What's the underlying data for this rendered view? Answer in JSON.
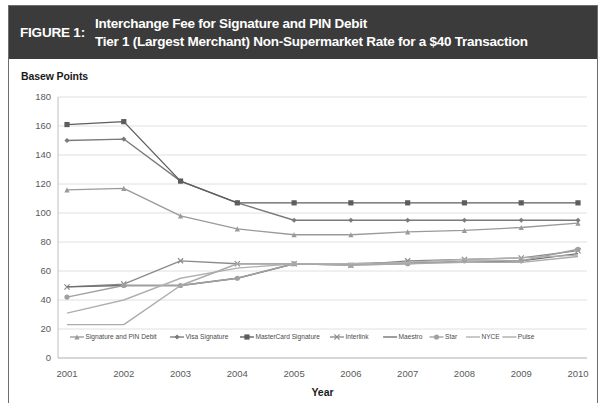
{
  "figure": {
    "label": "FIGURE 1:",
    "title_line1": "Interchange Fee for Signature and PIN Debit",
    "title_line2": "Tier 1 (Largest Merchant) Non-Supermarket Rate for a $40 Transaction",
    "header_bg": "#3b3b3b",
    "header_fg": "#ffffff"
  },
  "chart_data": {
    "type": "line",
    "title": "Interchange Fee for Signature and PIN Debit",
    "subtitle": "Tier 1 (Largest Merchant) Non-Supermarket Rate for a $40 Transaction",
    "xlabel": "Year",
    "ylabel": "Basew Points",
    "x": [
      2001,
      2002,
      2003,
      2004,
      2005,
      2006,
      2007,
      2008,
      2009,
      2010
    ],
    "xtick_labels": [
      "2001",
      "2002",
      "2003",
      "2004",
      "2005",
      "2006",
      "2007",
      "2008",
      "2009",
      "2010"
    ],
    "ytick_labels": [
      "0",
      "20",
      "40",
      "60",
      "80",
      "100",
      "120",
      "140",
      "160",
      "180"
    ],
    "yticks": [
      0,
      20,
      40,
      60,
      80,
      100,
      120,
      140,
      160,
      180
    ],
    "ylim": [
      0,
      180
    ],
    "grid": "horizontal",
    "legend_position": "bottom",
    "series": [
      {
        "name": "Signature and PIN Debit",
        "values": [
          116,
          117,
          98,
          89,
          85,
          85,
          87,
          88,
          90,
          93
        ],
        "color": "#9a9a9a",
        "marker": "triangle"
      },
      {
        "name": "Visa Signature",
        "values": [
          150,
          151,
          122,
          107,
          95,
          95,
          95,
          95,
          95,
          95
        ],
        "color": "#7a7a7a",
        "marker": "diamond"
      },
      {
        "name": "MasterCard Signature",
        "values": [
          161,
          163,
          122,
          107,
          107,
          107,
          107,
          107,
          107,
          107
        ],
        "color": "#5d5d5d",
        "marker": "square"
      },
      {
        "name": "Interlink",
        "values": [
          49,
          51,
          67,
          65,
          65,
          64,
          67,
          68,
          69,
          74
        ],
        "color": "#8b8b8b",
        "marker": "cross"
      },
      {
        "name": "Maestro",
        "values": [
          49,
          50,
          50,
          55,
          65,
          65,
          66,
          66,
          67,
          72
        ],
        "color": "#6f6f6f",
        "marker": "none"
      },
      {
        "name": "Star",
        "values": [
          42,
          50,
          50,
          55,
          65,
          64,
          65,
          67,
          67,
          75
        ],
        "color": "#a0a0a0",
        "marker": "circle"
      },
      {
        "name": "NYCE",
        "values": [
          31,
          40,
          55,
          62,
          65,
          65,
          66,
          68,
          69,
          71
        ],
        "color": "#b0b0b0",
        "marker": "none"
      },
      {
        "name": "Pulse",
        "values": [
          23,
          23,
          50,
          65,
          65,
          64,
          65,
          66,
          66,
          70
        ],
        "color": "#aaaaaa",
        "marker": "none"
      }
    ]
  }
}
